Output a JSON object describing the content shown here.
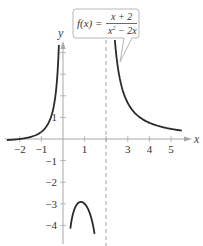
{
  "chart_data": {
    "type": "line",
    "title": "",
    "function_label": {
      "lhs": "f(x) =",
      "numerator": "x + 2",
      "denominator_base": "x",
      "denominator_exp": "2",
      "denominator_rest": " − 2x"
    },
    "xlabel": "x",
    "ylabel": "y",
    "xlim": [
      -2.6,
      5.8
    ],
    "ylim": [
      -4.5,
      4.6
    ],
    "x_ticks": [
      {
        "value": -2,
        "label": "−2"
      },
      {
        "value": -1,
        "label": "−1"
      },
      {
        "value": 1,
        "label": "1"
      },
      {
        "value": 2,
        "label": ""
      },
      {
        "value": 3,
        "label": "3"
      },
      {
        "value": 4,
        "label": "4"
      },
      {
        "value": 5,
        "label": "5"
      }
    ],
    "y_ticks": [
      {
        "value": 1,
        "label": "1"
      },
      {
        "value": 2,
        "label": ""
      },
      {
        "value": 3,
        "label": ""
      },
      {
        "value": 4,
        "label": ""
      },
      {
        "value": -1,
        "label": "−1"
      },
      {
        "value": -2,
        "label": "−2"
      },
      {
        "value": -3,
        "label": "−3"
      },
      {
        "value": -4,
        "label": "−4"
      }
    ],
    "vertical_asymptotes": [
      0,
      2
    ],
    "dashed_asymptote": 2,
    "horizontal_asymptote": 0,
    "grid": false,
    "series": [
      {
        "name": "f(x) = (x+2)/(x^2 - 2x)",
        "branches": [
          {
            "x_from": -2.6,
            "x_to": -0.19,
            "points": [
              [
                -2.6,
                -0.05
              ],
              [
                -2,
                0
              ],
              [
                -1,
                0.33
              ],
              [
                -0.5,
                1.2
              ],
              [
                -0.25,
                3.11
              ],
              [
                -0.19,
                4.6
              ]
            ]
          },
          {
            "x_from": 0.34,
            "x_to": 1.46,
            "points": [
              [
                0.34,
                -4.5
              ],
              [
                0.5,
                -3.33
              ],
              [
                0.83,
                -2.92
              ],
              [
                1,
                -3
              ],
              [
                1.25,
                -3.47
              ],
              [
                1.46,
                -4.3
              ]
            ]
          },
          {
            "x_from": 2.4,
            "x_to": 5.5,
            "points": [
              [
                2.4,
                4.58
              ],
              [
                2.5,
                3.6
              ],
              [
                3,
                1.67
              ],
              [
                4,
                0.75
              ],
              [
                5,
                0.47
              ],
              [
                5.5,
                0.39
              ]
            ]
          }
        ]
      }
    ],
    "mapping": {
      "origin_px": [
        63,
        139
      ],
      "unit_px": 21.6
    }
  },
  "colors": {
    "curve": "#2a2a2a",
    "axis": "#a8a8a8",
    "asymptote": "#9a9a9a",
    "callout_border": "#b8b8b8",
    "text": "#333333"
  }
}
